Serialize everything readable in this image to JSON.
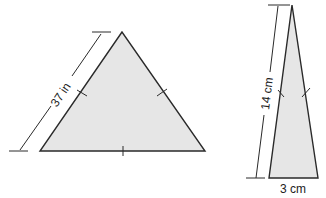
{
  "figures": [
    {
      "name": "equilateral-triangle",
      "side_label": "37 in",
      "fill": "#e6e6e6",
      "stroke": "#2a2a2a"
    },
    {
      "name": "isosceles-triangle",
      "side_label": "14 cm",
      "base_label": "3 cm",
      "fill": "#e6e6e6",
      "stroke": "#2a2a2a"
    }
  ]
}
